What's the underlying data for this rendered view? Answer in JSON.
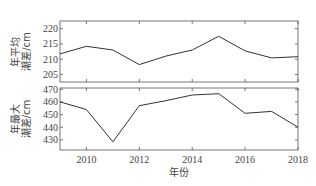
{
  "chart_data": [
    {
      "type": "line",
      "panel": "top",
      "title": "",
      "xlabel": "",
      "ylabel": "年平均\n潮差/cm",
      "ylabel_lines": [
        "年平均",
        "潮差/cm"
      ],
      "x": [
        2009,
        2010,
        2011,
        2012,
        2013,
        2014,
        2015,
        2016,
        2017,
        2018
      ],
      "values": [
        211.7,
        214.2,
        213.0,
        208.2,
        211.0,
        213.0,
        217.5,
        212.7,
        210.4,
        210.8
      ],
      "yticks": [
        205,
        210,
        215,
        220
      ],
      "ytick_labels": [
        "205",
        "210",
        "215",
        "220"
      ],
      "ylim": [
        202.5,
        222.5
      ],
      "xlim": [
        2009,
        2018
      ],
      "grid": false,
      "line_color": "#333333"
    },
    {
      "type": "line",
      "panel": "bottom",
      "title": "",
      "xlabel": "年份",
      "ylabel": "年最大\n潮差/cm",
      "ylabel_lines": [
        "年最大",
        "潮差/cm"
      ],
      "x": [
        2009,
        2010,
        2011,
        2012,
        2013,
        2014,
        2015,
        2016,
        2017,
        2018
      ],
      "values": [
        460,
        454,
        428.5,
        457,
        461,
        465.5,
        466.5,
        451,
        452.5,
        440
      ],
      "yticks": [
        430,
        440,
        450,
        460,
        470
      ],
      "ytick_labels": [
        "430",
        "440",
        "450",
        "460",
        "470"
      ],
      "xticks": [
        2010,
        2012,
        2014,
        2016,
        2018
      ],
      "xtick_labels": [
        "2010",
        "2012",
        "2014",
        "2016",
        "2018"
      ],
      "ylim": [
        422,
        471
      ],
      "xlim": [
        2009,
        2018
      ],
      "grid": false,
      "line_color": "#333333"
    }
  ]
}
